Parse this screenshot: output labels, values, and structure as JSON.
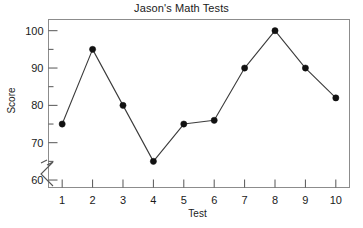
{
  "chart_data": {
    "type": "line",
    "title": "Jason's Math Tests",
    "xlabel": "Test",
    "ylabel": "Score",
    "categories": [
      1,
      2,
      3,
      4,
      5,
      6,
      7,
      8,
      9,
      10
    ],
    "x": [
      1,
      2,
      3,
      4,
      5,
      6,
      7,
      8,
      9,
      10
    ],
    "values": [
      75,
      95,
      80,
      65,
      75,
      76,
      90,
      100,
      90,
      82
    ],
    "series": [
      {
        "name": "Score",
        "values": [
          75,
          95,
          80,
          65,
          75,
          76,
          90,
          100,
          90,
          82
        ]
      }
    ],
    "xlim": [
      0.55,
      10.45
    ],
    "ylim": [
      58,
      103
    ],
    "ytick_labels": [
      "60",
      "70",
      "80",
      "90",
      "100"
    ],
    "yticks": [
      60,
      70,
      80,
      90,
      100
    ],
    "yminor_ticks": [
      65,
      75,
      85,
      95
    ],
    "xtick_labels": [
      "1",
      "2",
      "3",
      "4",
      "5",
      "6",
      "7",
      "8",
      "9",
      "10"
    ],
    "grid": false,
    "legend": false,
    "legend_position": "none",
    "axis_break": "y-axis break below 60",
    "marker": "filled-circle",
    "line_color": "#3b3b3b",
    "marker_color": "#111111",
    "frame_color": "#8c8c8c",
    "background_color": "#ffffff"
  },
  "figure": {
    "title": "Jason's Math Tests",
    "y_axis_title": "Score",
    "x_axis_title": "Test"
  }
}
